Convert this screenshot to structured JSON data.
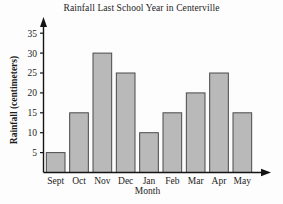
{
  "chart_data": {
    "type": "bar",
    "title": "Rainfall Last School Year in Centerville",
    "xlabel": "Month",
    "ylabel": "Rainfall (centimeters)",
    "categories": [
      "Sept",
      "Oct",
      "Nov",
      "Dec",
      "Jan",
      "Feb",
      "Mar",
      "Apr",
      "May"
    ],
    "values": [
      5,
      15,
      30,
      25,
      10,
      15,
      20,
      25,
      15
    ],
    "yticks": [
      5,
      10,
      15,
      20,
      25,
      30,
      35
    ],
    "ylim": [
      0,
      37
    ],
    "grid": false,
    "legend": null,
    "bar_color": "#b9b9b9",
    "bar_edge_color": "#4a4a4a",
    "axis_color": "#141414",
    "background_color": "#fdfdfd"
  },
  "axes": {
    "y_arrow": "up-arrow-icon",
    "x_arrow": "right-arrow-icon"
  }
}
